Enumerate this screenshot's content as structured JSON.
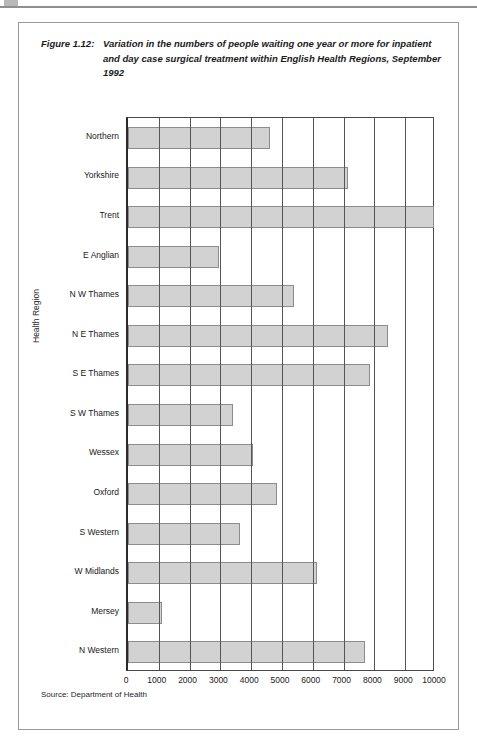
{
  "figure": {
    "label": "Figure 1.12:",
    "caption": "Variation in the numbers of people waiting one year or more for inpatient and day case surgical treatment within English Health Regions, September 1992",
    "source": "Source: Department of Health"
  },
  "chart_data": {
    "type": "bar",
    "orientation": "horizontal",
    "title": "Variation in the numbers of people waiting one year or more for inpatient and day case surgical treatment within English Health Regions, September 1992",
    "xlabel": "",
    "ylabel": "Health Region",
    "xlim": [
      0,
      10000
    ],
    "xticks": [
      0,
      1000,
      2000,
      3000,
      4000,
      5000,
      6000,
      7000,
      8000,
      9000,
      10000
    ],
    "xtick_labels": [
      "0",
      "1000",
      "2000",
      "3000",
      "4000",
      "5000",
      "6000",
      "7000",
      "8000",
      "9000",
      "10000"
    ],
    "grid": "vertical",
    "legend": "none",
    "bar_color": "#d2d2d2",
    "bar_edge_color": "#8c8c8c",
    "shadow_color": "#a9a9a9",
    "categories": [
      "Northern",
      "Yorkshire",
      "Trent",
      "E Anglian",
      "N W Thames",
      "N E Thames",
      "S E Thames",
      "S W Thames",
      "Wessex",
      "Oxford",
      "S Western",
      "W Midlands",
      "Mersey",
      "N Western"
    ],
    "values": [
      4600,
      7150,
      9950,
      2950,
      5400,
      8450,
      7850,
      3400,
      4050,
      4850,
      3650,
      6150,
      1100,
      7700
    ],
    "series": [
      {
        "name": "People waiting one year or more",
        "values": [
          4600,
          7150,
          9950,
          2950,
          5400,
          8450,
          7850,
          3400,
          4050,
          4850,
          3650,
          6150,
          1100,
          7700
        ]
      }
    ]
  }
}
